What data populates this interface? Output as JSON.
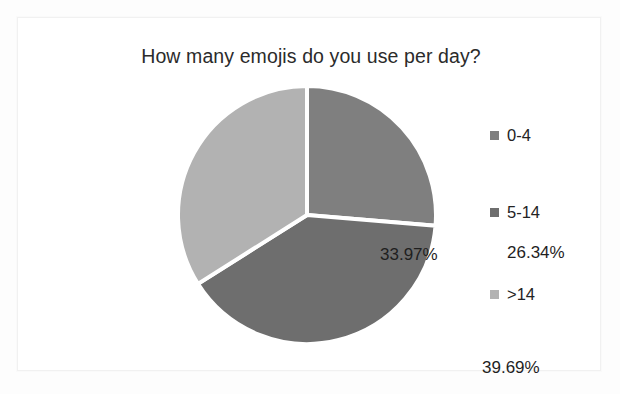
{
  "chart_data": {
    "type": "pie",
    "title": "How many emojis do you use per day?",
    "categories": [
      "0-4",
      "5-14",
      ">14"
    ],
    "values": [
      26.34,
      39.69,
      33.97
    ],
    "value_labels": [
      "26.34%",
      "39.69%",
      "33.97%"
    ],
    "unit": "percent",
    "xlabel": "",
    "ylabel": "",
    "legend_position": "right",
    "grid": false,
    "start_angle_deg": 0,
    "direction": "clockwise",
    "slice_colors": [
      "#7f7f7f",
      "#6e6e6e",
      "#b2b2b2"
    ],
    "slice_separator_color": "#ffffff",
    "label_color": "#1f1f1f",
    "title_color": "#2b2b2b",
    "background": "#ffffff"
  },
  "legend": {
    "items": [
      {
        "label": "0-4",
        "color": "#7f7f7f"
      },
      {
        "label": "5-14",
        "color": "#6e6e6e"
      },
      {
        "label": ">14",
        "color": "#b2b2b2"
      }
    ]
  }
}
